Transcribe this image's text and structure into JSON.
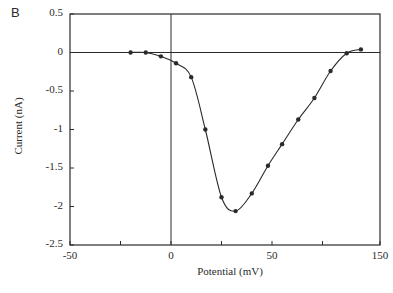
{
  "panel_label": "B",
  "chart_data": {
    "type": "line",
    "title": "",
    "xlabel": "Potential (mV)",
    "ylabel": "Current (nA)",
    "xlim": [
      -50,
      100
    ],
    "ylim": [
      -2.5,
      0.5
    ],
    "x_tick_labels": [
      "-50",
      "0",
      "50",
      "150"
    ],
    "x_tick_label_positions": [
      -50,
      0,
      50,
      100
    ],
    "x_minor_ticks": [
      -25,
      25,
      75
    ],
    "y_tick_labels": [
      "0.5",
      "0",
      "-0.5",
      "-1",
      "-1.5",
      "-2",
      "-2.5"
    ],
    "y_ticks": [
      0.5,
      0,
      -0.5,
      -1,
      -1.5,
      -2,
      -2.5
    ],
    "reference_lines": {
      "horizontal_y": 0,
      "vertical_x": 0
    },
    "grid": false,
    "legend": null,
    "series": [
      {
        "name": "I-V relation",
        "marker": "filled-circle",
        "line": "smooth",
        "x": [
          -20,
          -12.5,
          -5,
          2.5,
          10,
          17,
          25,
          32,
          40,
          48,
          55,
          63,
          71,
          79,
          87,
          94
        ],
        "y": [
          0.0,
          0.0,
          -0.05,
          -0.14,
          -0.32,
          -1.0,
          -1.88,
          -2.06,
          -1.83,
          -1.47,
          -1.19,
          -0.87,
          -0.59,
          -0.24,
          -0.01,
          0.04
        ]
      }
    ]
  },
  "colors": {
    "ink": "#2a2a2a",
    "background": "#ffffff"
  }
}
